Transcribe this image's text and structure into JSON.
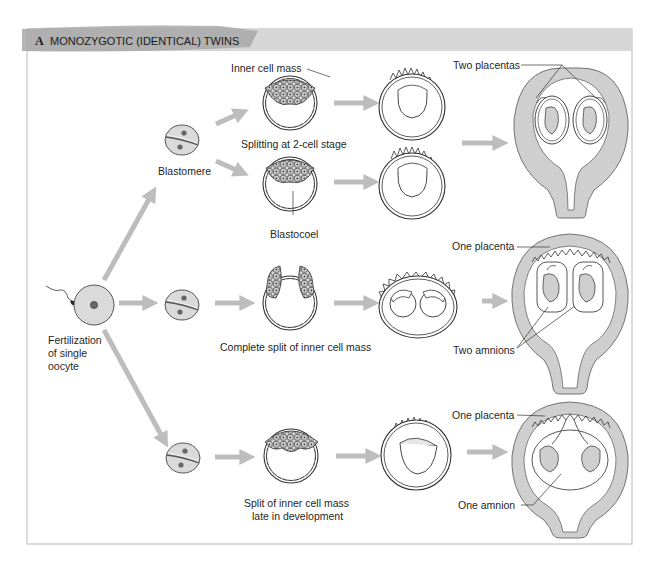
{
  "figure": {
    "panel_letter": "A",
    "title": "MONOZYGOTIC (IDENTICAL) TWINS",
    "colors": {
      "header_band": "#d4d4d4",
      "header_brush": "#a9a9a9",
      "frame": "#b5b5b5",
      "arrow": "#bdbdbd",
      "cell_fill": "#d9d9d9",
      "tissue_fill": "#cfcfcf",
      "outline": "#3a3a3a"
    }
  },
  "labels": {
    "inner_cell_mass": "Inner cell mass",
    "splitting_2cell": "Splitting at 2-cell stage",
    "blastomere": "Blastomere",
    "blastocoel": "Blastocoel",
    "two_placentas": "Two placentas",
    "one_placenta_mid": "One placenta",
    "two_amnions": "Two amnions",
    "complete_split": "Complete split of inner cell mass",
    "fert_line1": "Fertilization",
    "fert_line2": "of single",
    "fert_line3": "oocyte",
    "one_placenta_bottom": "One placenta",
    "one_amnion": "One amnion",
    "late_split_line1": "Split of inner cell mass",
    "late_split_line2": "late in development"
  },
  "pathways": [
    {
      "name": "Splitting at 2-cell stage",
      "outcome": "Two placentas, two amnions"
    },
    {
      "name": "Complete split of inner cell mass",
      "outcome": "One placenta, two amnions"
    },
    {
      "name": "Split of inner cell mass late in development",
      "outcome": "One placenta, one amnion"
    }
  ]
}
